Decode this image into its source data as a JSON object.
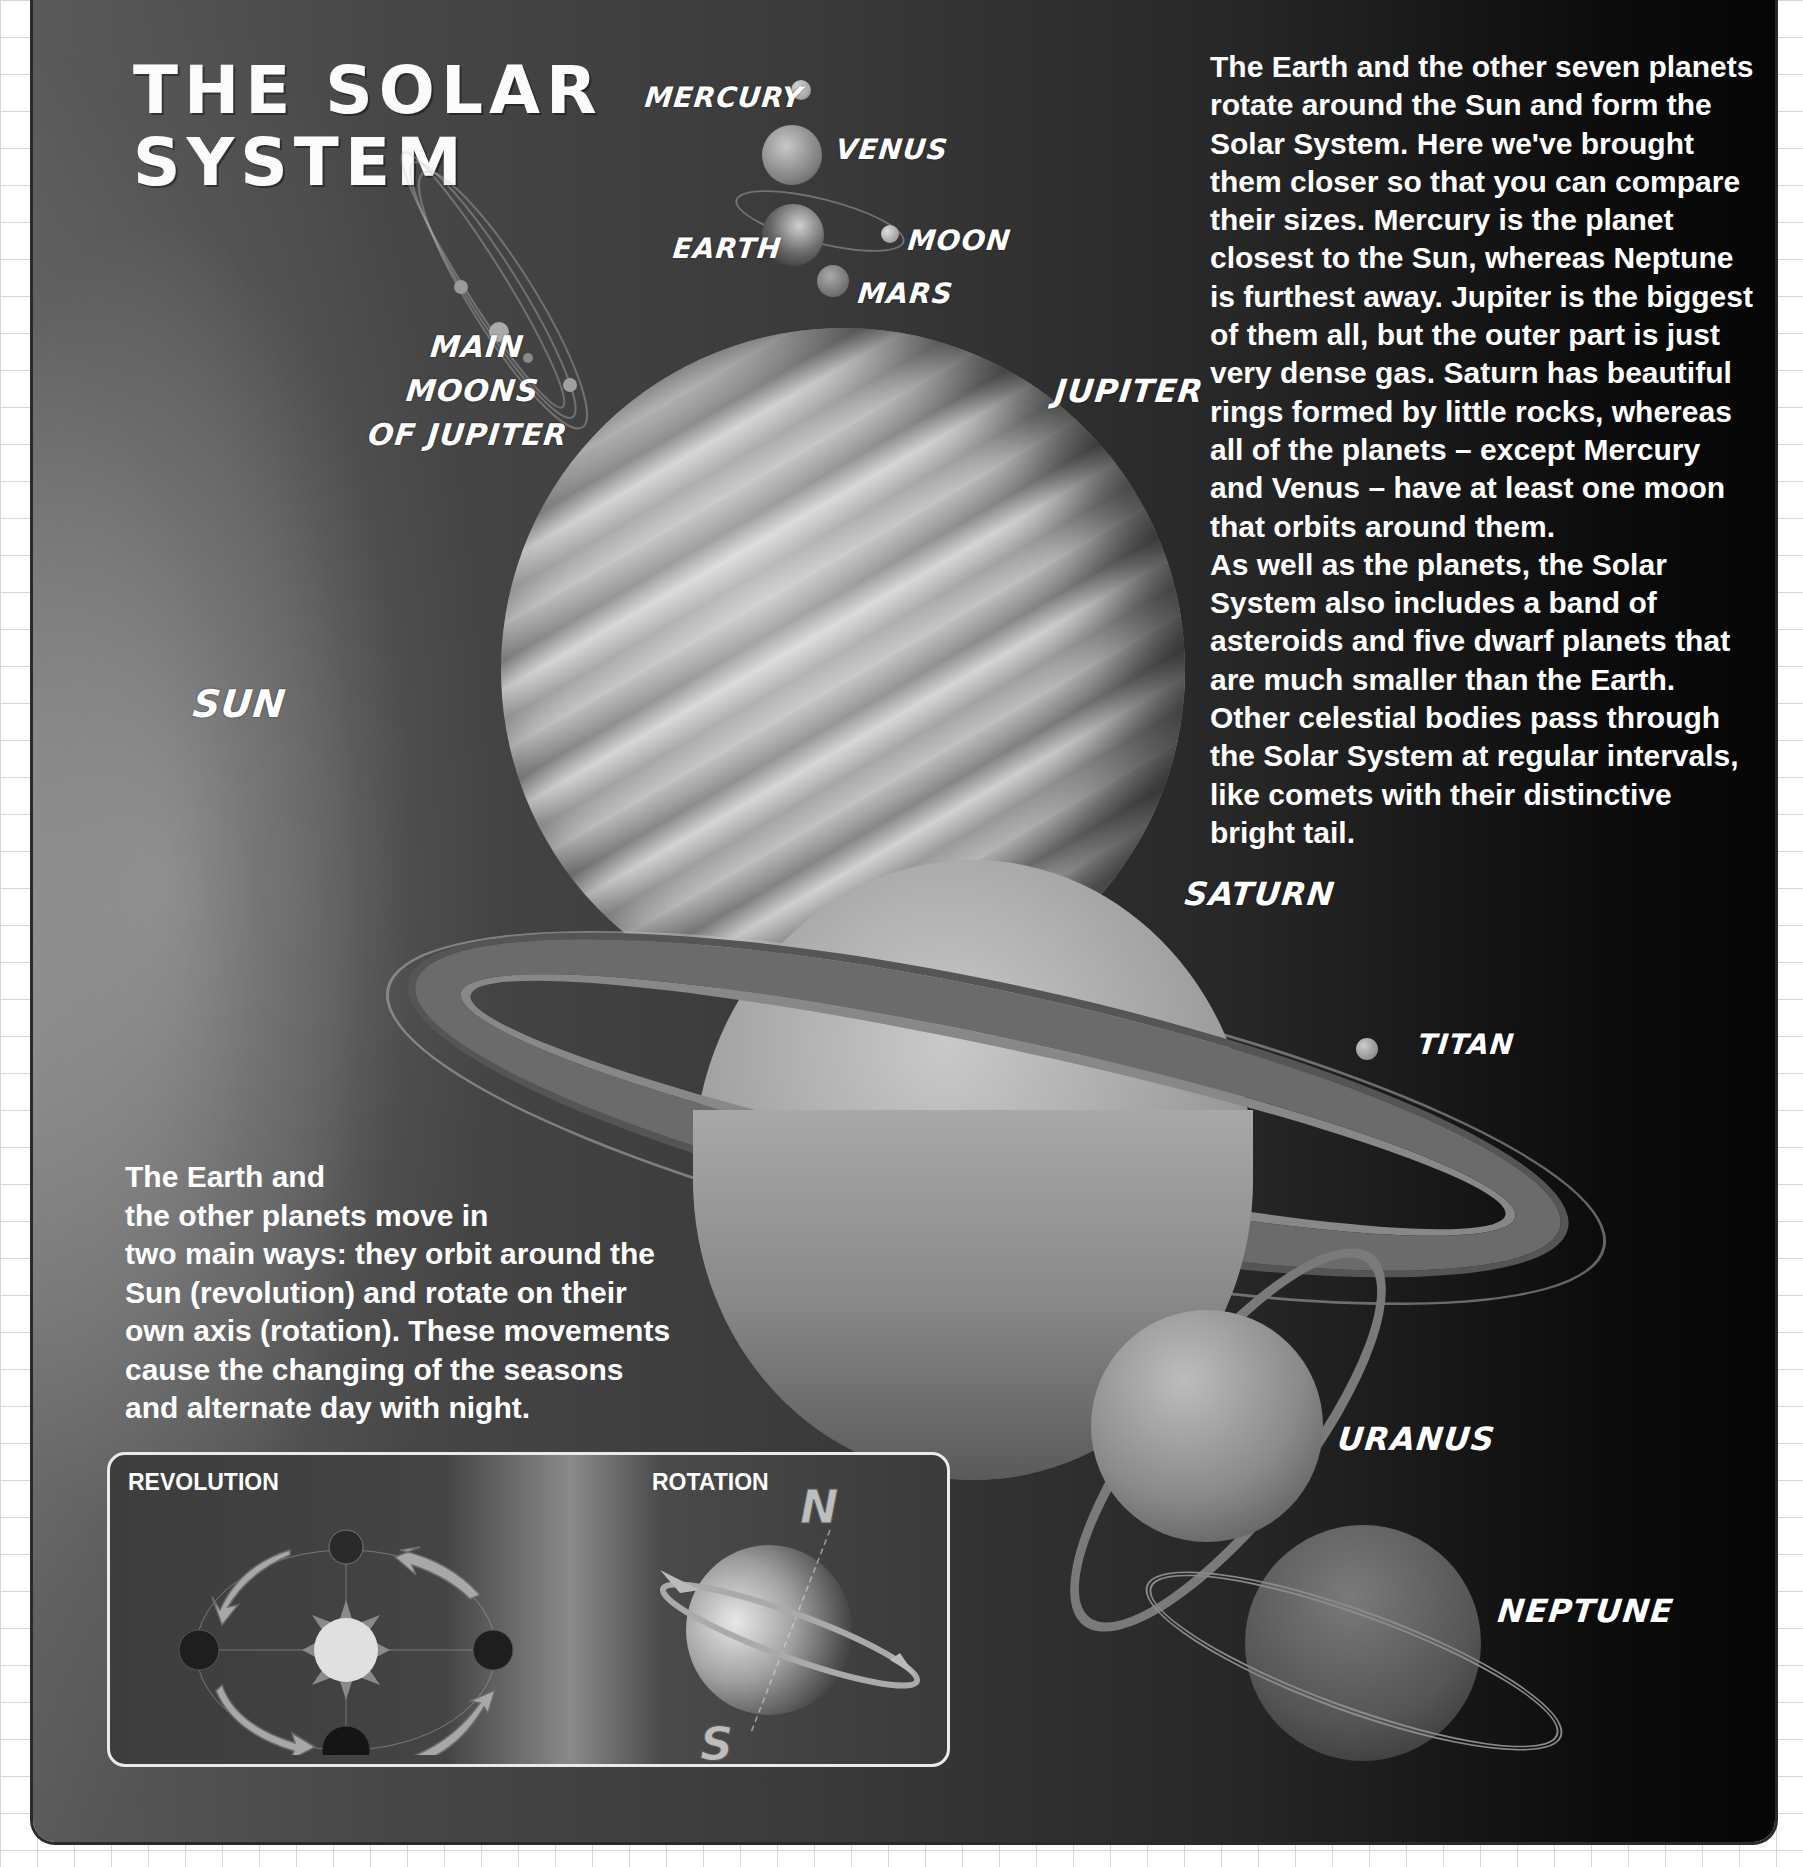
{
  "page": {
    "title_line1": "THE SOLAR",
    "title_line2": "SYSTEM",
    "colors": {
      "panel_dark": "#050505",
      "panel_mid": "#3a3a3a",
      "panel_light": "#5a5a5a",
      "text": "#ffffff",
      "grid": "#d6d6d6"
    }
  },
  "labels": {
    "mercury": "MERCURY",
    "venus": "VENUS",
    "earth": "EARTH",
    "moon": "MOON",
    "mars": "MARS",
    "main_moons_line1": "MAIN",
    "main_moons_line2": "MOONS",
    "main_moons_line3": "OF JUPITER",
    "jupiter": "JUPITER",
    "sun": "SUN",
    "saturn": "SATURN",
    "titan": "TITAN",
    "uranus": "URANUS",
    "neptune": "NEPTUNE"
  },
  "intro_text": {
    "lines": [
      "The Earth and the other seven planets",
      "rotate around the Sun and form the",
      "Solar System. Here we've brought",
      "them closer so that you can compare",
      "their sizes. Mercury is the planet",
      "closest to the Sun, whereas Neptune",
      "is furthest away. Jupiter is the biggest",
      "of them all, but the outer part is just",
      "very dense gas. Saturn has beautiful",
      "rings formed by little rocks, whereas",
      "all of the planets – except Mercury",
      "and Venus – have at least one moon",
      "that orbits around them.",
      "As well as the planets, the Solar",
      "System also includes a band of",
      "asteroids and five dwarf planets that",
      "are much smaller than the Earth.",
      "Other celestial bodies pass through",
      "the Solar System at regular intervals,",
      "like comets with their distinctive",
      "bright tail."
    ]
  },
  "movement_text": {
    "lines": [
      "The Earth and",
      "the other planets move in",
      "two main ways: they orbit around the",
      "Sun (revolution) and rotate on their",
      "own axis (rotation). These movements",
      "cause the changing of the seasons",
      "and alternate day with night."
    ]
  },
  "diagram_box": {
    "revolution_label": "REVOLUTION",
    "rotation_label": "ROTATION",
    "north_label": "N",
    "south_label": "S"
  }
}
